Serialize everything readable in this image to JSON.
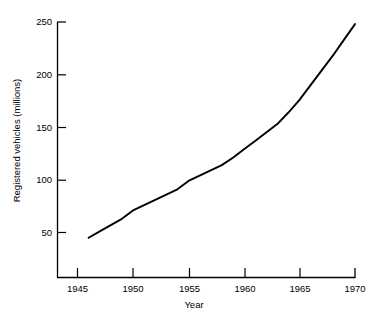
{
  "chart_data": {
    "type": "line",
    "title": "",
    "subtitle": "",
    "xlabel": "Year",
    "ylabel": "Registered vehicles (millions)",
    "xlim": [
      1943,
      1970
    ],
    "ylim": [
      0,
      250
    ],
    "grid": false,
    "legend": null,
    "line_color": "#000000",
    "x_ticks": [
      1945,
      1950,
      1955,
      1960,
      1965,
      1970
    ],
    "x_tick_labels": [
      "1945",
      "1950",
      "1955",
      "1960",
      "1965",
      "1970"
    ],
    "y_ticks": [
      50,
      100,
      150,
      200,
      250
    ],
    "y_tick_labels": [
      "50",
      "100",
      "150",
      "200",
      "250"
    ],
    "series": [
      {
        "name": "Registered vehicles",
        "x": [
          1946,
          1947,
          1948,
          1949,
          1950,
          1951,
          1952,
          1953,
          1954,
          1955,
          1956,
          1957,
          1958,
          1959,
          1960,
          1961,
          1962,
          1963,
          1964,
          1965,
          1966,
          1967,
          1968,
          1969,
          1970
        ],
        "values": [
          45,
          51,
          57,
          63,
          71,
          76,
          81,
          86,
          91,
          99,
          104,
          109,
          114,
          121,
          129,
          137,
          145,
          153,
          164,
          176,
          190,
          204,
          218,
          233,
          248
        ]
      }
    ],
    "annotations": []
  },
  "axes": {
    "y_axis_name": "y-axis",
    "x_axis_name": "x-axis"
  }
}
